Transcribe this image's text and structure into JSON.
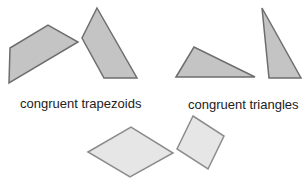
{
  "labels": {
    "trapezoids": "congruent trapezoids",
    "triangles": "congruent triangles"
  },
  "colors": {
    "dark_fill": "#c4c4c4",
    "dark_stroke": "#6e6e6e",
    "light_fill": "#e6e6e6",
    "light_stroke": "#8c8c8c"
  },
  "shapes": [
    {
      "name": "trapezoid-1",
      "points": "10,48 48,25 78,42 9,83"
    },
    {
      "name": "trapezoid-2",
      "points": "97,8 137,78 104,78 82,38"
    },
    {
      "name": "triangle-1",
      "points": "176,77 194,47 255,77"
    },
    {
      "name": "triangle-2",
      "points": "262,8 301,78 269,78"
    },
    {
      "name": "rhombus-1",
      "points": "88,152 131,127 173,153 130,177"
    },
    {
      "name": "square-1",
      "points": "193,116 224,136 208,169 177,149"
    }
  ]
}
